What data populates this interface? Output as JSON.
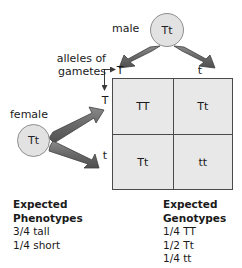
{
  "diagram": {
    "parents": {
      "male": {
        "label": "male",
        "genotype": "Tt"
      },
      "female": {
        "label": "female",
        "genotype": "Tt"
      }
    },
    "gametes": {
      "caption_line1": "alleles of",
      "caption_line2": "gametes",
      "male_alleles": [
        "T",
        "t"
      ],
      "female_alleles": [
        "T",
        "t"
      ]
    },
    "punnett": {
      "cells": [
        "TT",
        "Tt",
        "Tt",
        "tt"
      ]
    },
    "phenotypes": {
      "heading_line1": "Expected",
      "heading_line2": "Phenotypes",
      "items": [
        "3/4 tall",
        "1/4 short"
      ]
    },
    "genotypes": {
      "heading_line1": "Expected",
      "heading_line2": "Genotypes",
      "items": [
        "1/4 TT",
        "1/2 Tt",
        "1/4 tt"
      ]
    },
    "colors": {
      "circle_fill": "#e2e2e2",
      "circle_stroke": "#8d8d8d",
      "cell_fill": "#e8e8e8",
      "grid_line": "#4a4a4a",
      "thick_arrow": "#6b6b6b",
      "thin_arrow": "#3a3a3a",
      "text": "#1a1a1a",
      "background": "#ffffff"
    }
  }
}
